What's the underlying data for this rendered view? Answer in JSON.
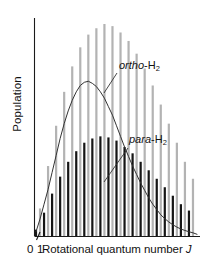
{
  "chart_data": {
    "type": "bar",
    "title": "",
    "subtitle": "",
    "xlabel": "Rotational quantum number J",
    "ylabel": "Population",
    "grid": false,
    "legend_position": "in-plot annotations",
    "x_tick_labels": [
      "0",
      "1"
    ],
    "x_ticks": [
      0,
      1
    ],
    "xlim": [
      0,
      40
    ],
    "ylim": [
      0,
      1.0
    ],
    "categories": [
      0,
      1,
      2,
      3,
      4,
      5,
      6,
      7,
      8,
      9,
      10,
      11,
      12,
      13,
      14,
      15,
      16,
      17,
      18,
      19,
      20,
      21,
      22,
      23,
      24,
      25,
      26,
      27,
      28,
      29,
      30,
      31,
      32,
      33,
      34,
      35,
      36,
      37,
      38,
      39
    ],
    "series": [
      {
        "name": "ortho-H2",
        "color": "#b3b3b3",
        "note": "odd J levels, nuclear spin weight 3",
        "values": [
          0.0,
          0.13,
          0.0,
          0.33,
          0.0,
          0.52,
          0.0,
          0.68,
          0.0,
          0.8,
          0.0,
          0.89,
          0.0,
          0.95,
          0.0,
          0.98,
          0.0,
          1.0,
          0.0,
          0.99,
          0.0,
          0.96,
          0.0,
          0.92,
          0.0,
          0.86,
          0.0,
          0.79,
          0.0,
          0.71,
          0.0,
          0.62,
          0.0,
          0.53,
          0.0,
          0.44,
          0.0,
          0.35,
          0.0,
          0.27
        ]
      },
      {
        "name": "para-H2",
        "color": "#151515",
        "note": "even J levels, nuclear spin weight 1",
        "values": [
          0.03,
          0.0,
          0.11,
          0.0,
          0.2,
          0.0,
          0.28,
          0.0,
          0.35,
          0.0,
          0.4,
          0.0,
          0.44,
          0.0,
          0.46,
          0.0,
          0.47,
          0.0,
          0.465,
          0.0,
          0.45,
          0.0,
          0.42,
          0.0,
          0.39,
          0.0,
          0.35,
          0.0,
          0.31,
          0.0,
          0.27,
          0.0,
          0.23,
          0.0,
          0.19,
          0.0,
          0.15,
          0.0,
          0.12,
          0.0
        ]
      },
      {
        "name": "envelope-curve",
        "color": "#333333",
        "type": "line",
        "note": "smooth Boltzmann population envelope",
        "values": [
          0.02,
          0.08,
          0.15,
          0.22,
          0.3,
          0.38,
          0.46,
          0.53,
          0.59,
          0.64,
          0.68,
          0.71,
          0.725,
          0.73,
          0.72,
          0.705,
          0.68,
          0.65,
          0.61,
          0.57,
          0.52,
          0.47,
          0.42,
          0.375,
          0.33,
          0.29,
          0.25,
          0.215,
          0.18,
          0.15,
          0.125,
          0.1,
          0.082,
          0.066,
          0.053,
          0.042,
          0.033,
          0.026,
          0.02,
          0.015
        ]
      }
    ],
    "annotations": [
      {
        "id": "ortho",
        "text_italic": "ortho",
        "text_rest": "-H",
        "subscript": "2"
      },
      {
        "id": "para",
        "text_italic": "para",
        "text_rest": "-H",
        "subscript": "2"
      }
    ]
  },
  "axes": {
    "y_label": "Population",
    "x_label_prefix": "Rotational quantum number",
    "x_label_variable": "J",
    "tick_zero": "0",
    "tick_one": "1"
  },
  "colors": {
    "ortho_bar": "#b3b3b3",
    "para_bar": "#151515",
    "curve": "#333333",
    "axis": "#1a1a1a",
    "background": "#ffffff",
    "text": "#111111"
  }
}
